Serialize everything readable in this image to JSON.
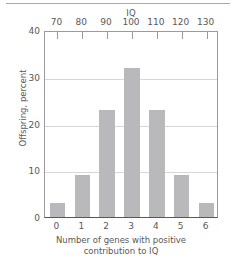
{
  "chart_data": {
    "type": "bar",
    "title": "",
    "categories": [
      "0",
      "1",
      "2",
      "3",
      "4",
      "5",
      "6"
    ],
    "values": [
      3.1,
      8.9,
      22.8,
      31.9,
      22.8,
      8.9,
      3.1
    ],
    "series": [
      {
        "name": "Offspring, percent",
        "values": [
          3.1,
          8.9,
          22.8,
          31.9,
          22.8,
          8.9,
          3.1
        ]
      }
    ],
    "xlabel": "Number of genes with positive contribution to IQ",
    "xlabel_line1": "Number of genes with positive",
    "xlabel_line2": "contribution to IQ",
    "ylabel": "Offspring, percent",
    "ylim": [
      0,
      40
    ],
    "yticks": [
      0,
      10,
      20,
      30,
      40
    ],
    "ytick_labels": [
      "0",
      "10",
      "20",
      "30",
      "40"
    ],
    "xtick_labels": [
      "0",
      "1",
      "2",
      "3",
      "4",
      "5",
      "6"
    ],
    "secondary_axis": {
      "position": "top",
      "label": "IQ",
      "ticks": [
        70,
        80,
        90,
        100,
        110,
        120,
        130
      ],
      "tick_labels": [
        "70",
        "80",
        "90",
        "100",
        "110",
        "120",
        "130"
      ],
      "range": [
        70,
        130
      ]
    },
    "grid": "horizontal",
    "legend": "none",
    "bar_color": "#b9b9bb",
    "gridline_color": "#d6d6d8",
    "axis_color": "#58585a",
    "text_color": "#58585a",
    "background": "#ffffff"
  }
}
